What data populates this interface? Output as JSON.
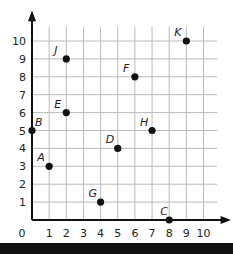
{
  "chart_data": {
    "type": "scatter",
    "title": "",
    "xlabel": "",
    "ylabel": "",
    "xlim": [
      0,
      10
    ],
    "ylim": [
      0,
      10
    ],
    "grid": true,
    "x_ticks": [
      "0",
      "1",
      "2",
      "3",
      "4",
      "5",
      "6",
      "7",
      "8",
      "9",
      "10"
    ],
    "y_ticks": [
      "1",
      "2",
      "3",
      "4",
      "5",
      "6",
      "7",
      "8",
      "9",
      "10"
    ],
    "points": [
      {
        "label": "A",
        "x": 1,
        "y": 3
      },
      {
        "label": "B",
        "x": 0,
        "y": 5
      },
      {
        "label": "C",
        "x": 8,
        "y": 0
      },
      {
        "label": "D",
        "x": 5,
        "y": 4
      },
      {
        "label": "E",
        "x": 2,
        "y": 6
      },
      {
        "label": "F",
        "x": 6,
        "y": 8
      },
      {
        "label": "G",
        "x": 4,
        "y": 1
      },
      {
        "label": "H",
        "x": 7,
        "y": 5
      },
      {
        "label": "J",
        "x": 2,
        "y": 9
      },
      {
        "label": "K",
        "x": 9,
        "y": 10
      }
    ]
  }
}
